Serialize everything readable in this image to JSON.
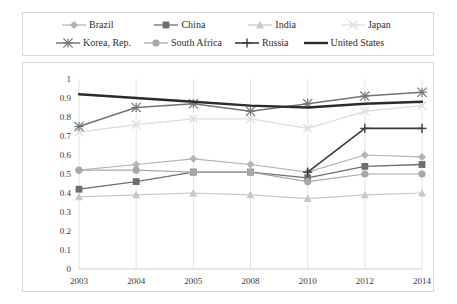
{
  "chart_data": {
    "type": "line",
    "title": "",
    "xlabel": "",
    "ylabel": "",
    "categories": [
      "2003",
      "2004",
      "2005",
      "2008",
      "2010",
      "2012",
      "2014"
    ],
    "ylim": [
      0,
      1
    ],
    "yticks": [
      "0",
      "0.1",
      "0.2",
      "0.3",
      "0.4",
      "0.5",
      "0.6",
      "0.7",
      "0.8",
      "0.9",
      "1"
    ],
    "grid": "vertical",
    "legend_position": "top",
    "series": [
      {
        "name": "Brazil",
        "marker": "diamond",
        "color": "#b4b4b4",
        "line_width": 1.2,
        "values": [
          0.52,
          0.55,
          0.58,
          0.55,
          0.51,
          0.6,
          0.59
        ]
      },
      {
        "name": "China",
        "marker": "square",
        "color": "#6e6e6e",
        "line_width": 1.3,
        "values": [
          0.42,
          0.46,
          0.51,
          0.51,
          0.48,
          0.54,
          0.55
        ]
      },
      {
        "name": "India",
        "marker": "triangle",
        "color": "#c8c8c8",
        "line_width": 1.2,
        "values": [
          0.38,
          0.39,
          0.4,
          0.39,
          0.37,
          0.39,
          0.4
        ]
      },
      {
        "name": "Japan",
        "marker": "x",
        "color": "#dedede",
        "line_width": 1.4,
        "values": [
          0.72,
          0.76,
          0.79,
          0.79,
          0.74,
          0.83,
          0.86
        ]
      },
      {
        "name": "Korea, Rep.",
        "marker": "star",
        "color": "#747474",
        "line_width": 1.5,
        "values": [
          0.75,
          0.85,
          0.87,
          0.83,
          0.87,
          0.91,
          0.93
        ]
      },
      {
        "name": "South Africa",
        "marker": "circle",
        "color": "#a8a8a8",
        "line_width": 1.2,
        "values": [
          0.52,
          0.52,
          0.51,
          0.51,
          0.46,
          0.5,
          0.5
        ]
      },
      {
        "name": "Russia",
        "marker": "plus",
        "color": "#3c3c3c",
        "line_width": 1.6,
        "values": [
          null,
          null,
          null,
          null,
          0.51,
          0.74,
          0.74
        ]
      },
      {
        "name": "United States",
        "marker": "none",
        "color": "#2b2b2b",
        "line_width": 2.4,
        "values": [
          0.92,
          0.9,
          0.88,
          0.86,
          0.85,
          0.87,
          0.88
        ]
      }
    ]
  },
  "legend": {
    "rows": [
      [
        "Brazil",
        "China",
        "India",
        "Japan"
      ],
      [
        "Korea, Rep.",
        "South Africa",
        "Russia",
        "United States"
      ]
    ]
  },
  "colors": {
    "frame": "#d8d8d8",
    "gridline": "#e4e4e4",
    "text": "#3a3a3a",
    "background": "#ffffff"
  }
}
